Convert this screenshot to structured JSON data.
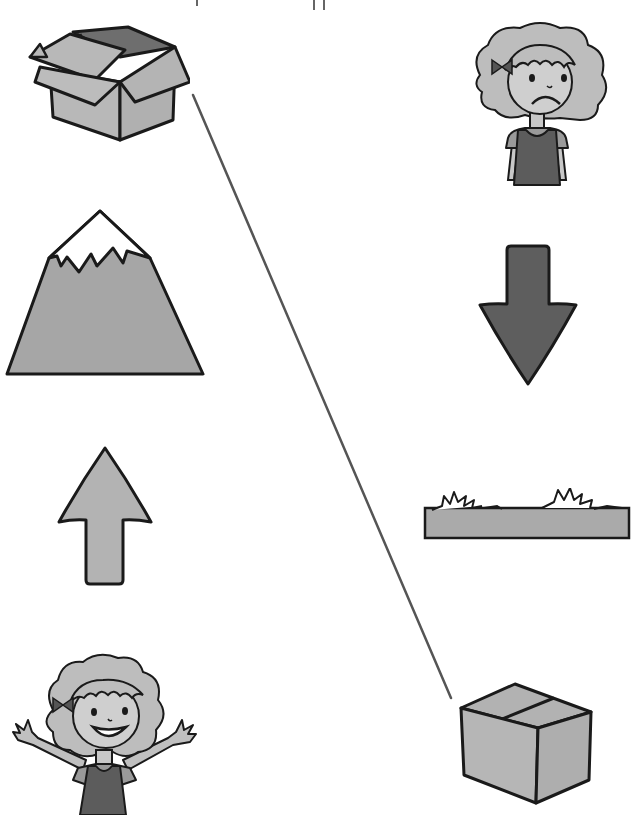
{
  "worksheet": {
    "type": "matching-opposites",
    "colors": {
      "background": "#ffffff",
      "outline": "#1a1a1a",
      "light_fill": "#b5b5b5",
      "mid_fill": "#a8a8a8",
      "dark_fill": "#5a5a5a",
      "line": "#555555"
    },
    "left_column": [
      {
        "id": "open-box",
        "label": "open box"
      },
      {
        "id": "mountain",
        "label": "mountain"
      },
      {
        "id": "up-arrow",
        "label": "up arrow"
      },
      {
        "id": "happy-girl",
        "label": "happy girl"
      }
    ],
    "right_column": [
      {
        "id": "sad-girl",
        "label": "sad girl"
      },
      {
        "id": "down-arrow",
        "label": "down arrow"
      },
      {
        "id": "flat-ground",
        "label": "flat ground"
      },
      {
        "id": "closed-box",
        "label": "closed box"
      }
    ],
    "connections": [
      {
        "from": "open-box",
        "to": "closed-box",
        "x1": 193,
        "y1": 95,
        "x2": 451,
        "y2": 698
      }
    ]
  }
}
